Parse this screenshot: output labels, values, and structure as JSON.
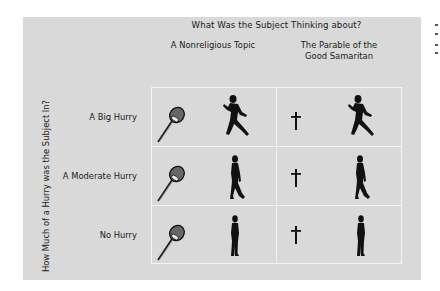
{
  "figure": {
    "title": "What Was the Subject Thinking about?",
    "columns": [
      {
        "label": "A Nonreligious Topic",
        "icon": "microphone-icon"
      },
      {
        "label": "The Parable of the\nGood Samaritan",
        "label_line1": "The Parable of the",
        "label_line2": "Good Samaritan",
        "icon": "cross-icon"
      }
    ],
    "y_axis_title": "How Much of a Hurry was the Subject In?",
    "rows": [
      {
        "label": "A Big Hurry",
        "figure_icon": "running-person-icon"
      },
      {
        "label": "A Moderate Hurry",
        "figure_icon": "walking-person-icon"
      },
      {
        "label": "No Hurry",
        "figure_icon": "standing-person-icon"
      }
    ]
  },
  "colors": {
    "panel_background": "#d9d9d9",
    "grid_lines": "#f4f4f4",
    "icon_fill": "#111111",
    "page_background": "#ffffff"
  }
}
